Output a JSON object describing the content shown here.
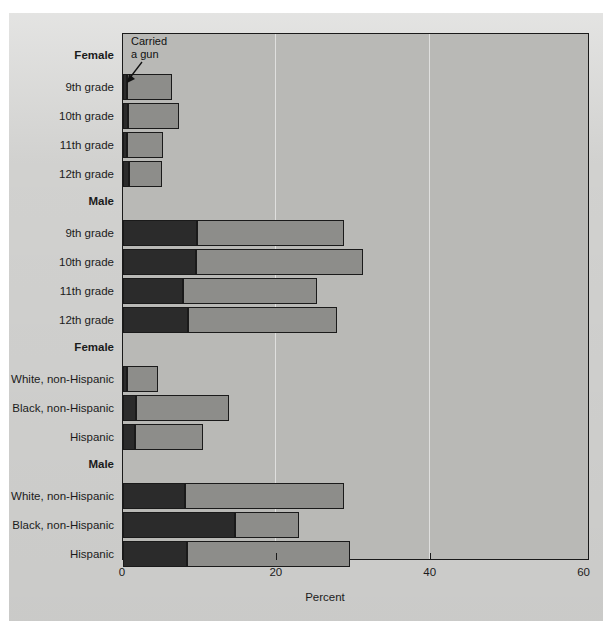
{
  "chart_data": {
    "type": "bar",
    "orientation": "horizontal",
    "stacked": true,
    "title": "",
    "xlabel": "Percent",
    "ylabel": "",
    "xlim": [
      0,
      60
    ],
    "xticks": [
      0,
      20,
      40,
      60
    ],
    "xticklabels": [
      "0",
      "20",
      "40",
      "60"
    ],
    "grid": "vertical-at-xticks",
    "legend_position": "inline-annotation",
    "annotation": {
      "line1": "Carried",
      "line2": "a gun"
    },
    "series": [
      {
        "name": "Carried a gun",
        "color": "#2b2b2b"
      },
      {
        "name": "Carried a weapon (remainder)",
        "color": "#8d8d8a"
      }
    ],
    "groups": [
      {
        "header": "Female",
        "categories": [
          "9th grade",
          "10th grade",
          "11th grade",
          "12th grade"
        ],
        "values_dark": [
          0.5,
          0.6,
          0.5,
          0.8
        ],
        "values_total": [
          6.4,
          7.3,
          5.2,
          5.1
        ]
      },
      {
        "header": "Male",
        "categories": [
          "9th grade",
          "10th grade",
          "11th grade",
          "12th grade"
        ],
        "values_dark": [
          9.6,
          9.5,
          7.8,
          8.4
        ],
        "values_total": [
          28.7,
          31.2,
          25.2,
          27.8
        ]
      },
      {
        "header": "Female",
        "categories": [
          "White, non-Hispanic",
          "Black, non-Hispanic",
          "Hispanic"
        ],
        "values_dark": [
          0.5,
          1.7,
          1.5
        ],
        "values_total": [
          4.5,
          13.8,
          10.4
        ]
      },
      {
        "header": "Male",
        "categories": [
          "White, non-Hispanic",
          "Black, non-Hispanic",
          "Hispanic"
        ],
        "values_dark": [
          8.0,
          14.5,
          8.3
        ],
        "values_total": [
          28.7,
          22.9,
          29.5
        ]
      }
    ]
  },
  "axis": {
    "xlabel": "Percent",
    "ticks": [
      "0",
      "20",
      "40",
      "60"
    ]
  },
  "annotation": {
    "line1": "Carried",
    "line2": "a gun"
  },
  "rows": [
    {
      "kind": "header",
      "label": "Female"
    },
    {
      "kind": "bar",
      "label": "9th grade",
      "dark": 0.5,
      "total": 6.4
    },
    {
      "kind": "bar",
      "label": "10th grade",
      "dark": 0.6,
      "total": 7.3
    },
    {
      "kind": "bar",
      "label": "11th grade",
      "dark": 0.5,
      "total": 5.2
    },
    {
      "kind": "bar",
      "label": "12th grade",
      "dark": 0.8,
      "total": 5.1
    },
    {
      "kind": "header",
      "label": "Male"
    },
    {
      "kind": "bar",
      "label": "9th grade",
      "dark": 9.6,
      "total": 28.7
    },
    {
      "kind": "bar",
      "label": "10th grade",
      "dark": 9.5,
      "total": 31.2
    },
    {
      "kind": "bar",
      "label": "11th grade",
      "dark": 7.8,
      "total": 25.2
    },
    {
      "kind": "bar",
      "label": "12th grade",
      "dark": 8.4,
      "total": 27.8
    },
    {
      "kind": "header",
      "label": "Female"
    },
    {
      "kind": "bar",
      "label": "White, non-Hispanic",
      "dark": 0.5,
      "total": 4.5
    },
    {
      "kind": "bar",
      "label": "Black, non-Hispanic",
      "dark": 1.7,
      "total": 13.8
    },
    {
      "kind": "bar",
      "label": "Hispanic",
      "dark": 1.5,
      "total": 10.4
    },
    {
      "kind": "header",
      "label": "Male"
    },
    {
      "kind": "bar",
      "label": "White, non-Hispanic",
      "dark": 8.0,
      "total": 28.7
    },
    {
      "kind": "bar",
      "label": "Black, non-Hispanic",
      "dark": 14.5,
      "total": 22.9
    },
    {
      "kind": "bar",
      "label": "Hispanic",
      "dark": 8.3,
      "total": 29.5
    }
  ],
  "colors": {
    "dark_segment": "#2b2b2b",
    "light_segment": "#8d8d8a",
    "plot_background": "#b9b9b6",
    "page_background": "#d5d5d3"
  }
}
